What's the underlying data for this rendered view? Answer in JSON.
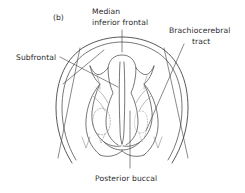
{
  "figure": {
    "panel_letter": "(b)",
    "background_color": "#ffffff",
    "line_color": "#3a3a3a",
    "text_color": "#2b2b2b",
    "labels": {
      "median_line1": "Median",
      "median_line2": "inferior frontal",
      "brachiocerebral_line1": "Brachiocerebral",
      "brachiocerebral_line2": "tract",
      "subfrontal": "Subfrontal",
      "posterior_buccal": "Posterior buccal"
    },
    "icons": {
      "median_leader": "leader-line",
      "brachiocerebral_leader": "leader-line",
      "subfrontal_leader": "leader-line",
      "posterior_buccal_leader": "leader-line"
    }
  }
}
